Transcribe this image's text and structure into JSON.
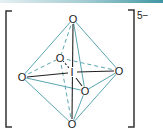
{
  "diagram": {
    "charge": "5−",
    "colors": {
      "edge": "#5aa6b0",
      "bond": "#222222",
      "bracket": "#333333",
      "topbar_start": "#e6f0f2",
      "topbar_end": "#3f97a3"
    },
    "atoms": {
      "center": {
        "label": "I",
        "x": 72,
        "y": 72
      },
      "top": {
        "label": "O",
        "x": 73,
        "y": 19
      },
      "bottom": {
        "label": "O",
        "x": 72,
        "y": 124
      },
      "left": {
        "label": "O",
        "x": 22,
        "y": 77
      },
      "right": {
        "label": "O",
        "x": 119,
        "y": 71
      },
      "back": {
        "label": "O",
        "x": 60,
        "y": 58
      },
      "front": {
        "label": "O",
        "x": 85,
        "y": 91
      }
    },
    "bonds": [
      {
        "from": "center",
        "to": "top",
        "style": "solid"
      },
      {
        "from": "center",
        "to": "bottom",
        "style": "solid"
      },
      {
        "from": "center",
        "to": "left",
        "style": "solid"
      },
      {
        "from": "center",
        "to": "right",
        "style": "solid"
      },
      {
        "from": "center",
        "to": "front",
        "style": "solid"
      },
      {
        "from": "center",
        "to": "back",
        "style": "dashed"
      }
    ],
    "edges": [
      {
        "from": "top",
        "to": "left",
        "style": "solid"
      },
      {
        "from": "top",
        "to": "right",
        "style": "solid"
      },
      {
        "from": "top",
        "to": "front",
        "style": "solid"
      },
      {
        "from": "top",
        "to": "back",
        "style": "dashed"
      },
      {
        "from": "bottom",
        "to": "left",
        "style": "solid"
      },
      {
        "from": "bottom",
        "to": "right",
        "style": "solid"
      },
      {
        "from": "bottom",
        "to": "front",
        "style": "solid"
      },
      {
        "from": "bottom",
        "to": "back",
        "style": "dashed"
      },
      {
        "from": "left",
        "to": "front",
        "style": "solid"
      },
      {
        "from": "front",
        "to": "right",
        "style": "solid"
      },
      {
        "from": "left",
        "to": "back",
        "style": "dashed"
      },
      {
        "from": "back",
        "to": "right",
        "style": "dashed"
      }
    ]
  }
}
